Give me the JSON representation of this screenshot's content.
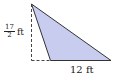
{
  "figure": {
    "type": "triangle",
    "fill_color": "#c8cdf0",
    "stroke_color": "#333333",
    "vertices": {
      "apex": [
        31.5,
        4
      ],
      "base_left": [
        50.5,
        60.5
      ],
      "base_right": [
        111,
        60.5
      ]
    },
    "height_line": {
      "style": "dashed",
      "from": [
        31.5,
        4
      ],
      "to": [
        31.5,
        60.5
      ]
    },
    "base_extension": {
      "style": "dashed",
      "from": [
        31.5,
        60.5
      ],
      "to": [
        50.5,
        60.5
      ]
    }
  },
  "labels": {
    "height": {
      "numerator": "17",
      "denominator": "2",
      "unit": "ft"
    },
    "base": {
      "text": "12 ft"
    }
  }
}
